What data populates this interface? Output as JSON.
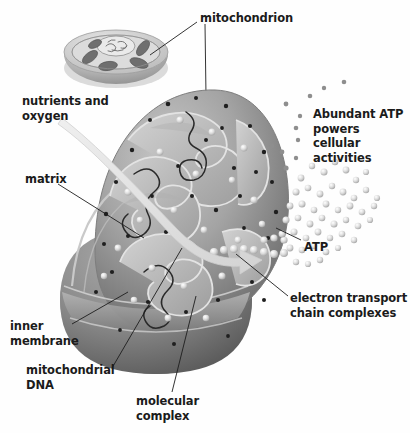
{
  "figure": {
    "background_color": "#fefefe",
    "text_color": "#1b1b1b"
  },
  "labels": {
    "mitochondrion": "mitochondrion",
    "nutrients_and_oxygen": "nutrients and\noxygen",
    "matrix": "matrix",
    "abundant_atp": "Abundant ATP\npowers cellular\nactivities",
    "atp": "ATP",
    "electron_transport": "electron transport\nchain complexes",
    "inner_membrane": "inner\nmembrane",
    "mitochondrial_dna": "mitochondrial\nDNA",
    "molecular_complex": "molecular\ncomplex"
  },
  "illustration": {
    "inset_cell": {
      "name": "cell-cutaway-inset",
      "description": "cut-away cell showing nucleus and several mitochondria",
      "fill_light": "#d9d9d9",
      "fill_dark": "#8e8e8e"
    },
    "main_mitochondrion": {
      "name": "mitochondrion-cutaway",
      "outer_membrane_color": "#9a9a9a",
      "inner_membrane_color": "#b9b9b9",
      "matrix_color": "#c6c6c6",
      "body_shadow_color": "#6f6f6f"
    },
    "atp_spray": {
      "name": "atp-particles",
      "particle_color": "#c9c9c9",
      "particle_count": 120
    },
    "nutrient_arrow": {
      "name": "nutrient-oxygen-arrow",
      "color": "#e2e2e2"
    }
  }
}
